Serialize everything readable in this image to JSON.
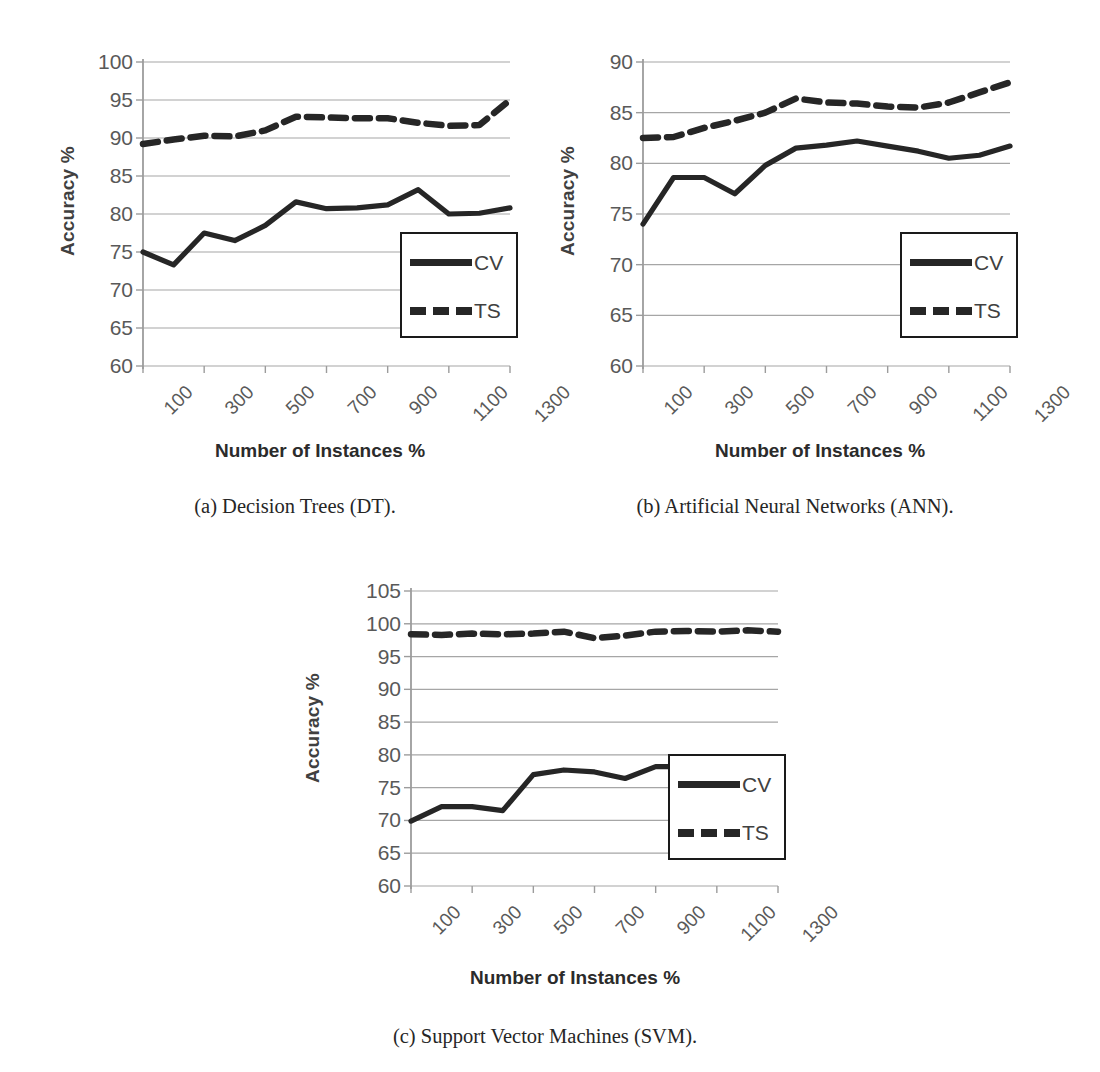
{
  "figure": {
    "axis_titles": {
      "y": "Accuracy %",
      "x": "Number of Instances %"
    },
    "legend": {
      "cv_label": "CV",
      "ts_label": "TS"
    },
    "captions": {
      "a": "(a)  Decision Trees (DT).",
      "b": "(b)  Artificial Neural Networks (ANN).",
      "c": "(c)  Support Vector Machines (SVM)."
    },
    "colors": {
      "line": "#262626",
      "gridline": "#a6a6a6",
      "axis": "#9c9c9c",
      "tick_text": "#595959",
      "title_text": "#2b2b2b"
    }
  },
  "chart_data": [
    {
      "id": "dt",
      "type": "line",
      "title": "(a)  Decision Trees (DT).",
      "xlabel": "Number of Instances %",
      "ylabel": "Accuracy %",
      "ylim": [
        60,
        100
      ],
      "yticks": [
        60,
        65,
        70,
        75,
        80,
        85,
        90,
        95,
        100
      ],
      "x": [
        100,
        200,
        300,
        400,
        500,
        600,
        700,
        800,
        900,
        1000,
        1100,
        1200,
        1300
      ],
      "xtick_labels": [
        "100",
        "300",
        "500",
        "700",
        "900",
        "1100",
        "1300"
      ],
      "xtick_values": [
        100,
        300,
        500,
        700,
        900,
        1100,
        1300
      ],
      "grid": true,
      "legend_position": "lower-right",
      "series": [
        {
          "name": "CV",
          "style": "solid",
          "values": [
            75.0,
            73.3,
            77.5,
            76.5,
            78.5,
            81.6,
            80.7,
            80.8,
            81.2,
            83.2,
            80.0,
            80.1,
            80.8
          ]
        },
        {
          "name": "TS",
          "style": "dashed",
          "values": [
            89.2,
            89.8,
            90.3,
            90.2,
            91.0,
            92.8,
            92.7,
            92.6,
            92.6,
            92.0,
            91.6,
            91.7,
            95.0
          ]
        }
      ]
    },
    {
      "id": "ann",
      "type": "line",
      "title": "(b)  Artificial Neural Networks (ANN).",
      "xlabel": "Number of Instances %",
      "ylabel": "Accuracy %",
      "ylim": [
        60,
        90
      ],
      "yticks": [
        60,
        65,
        70,
        75,
        80,
        85,
        90
      ],
      "x": [
        100,
        200,
        300,
        400,
        500,
        600,
        700,
        800,
        900,
        1000,
        1100,
        1200,
        1300
      ],
      "xtick_labels": [
        "100",
        "300",
        "500",
        "700",
        "900",
        "1100",
        "1300"
      ],
      "xtick_values": [
        100,
        300,
        500,
        700,
        900,
        1100,
        1300
      ],
      "grid": true,
      "legend_position": "lower-right",
      "series": [
        {
          "name": "CV",
          "style": "solid",
          "values": [
            74.0,
            78.6,
            78.6,
            77.0,
            79.8,
            81.5,
            81.8,
            82.2,
            81.7,
            81.2,
            80.5,
            80.8,
            81.7
          ]
        },
        {
          "name": "TS",
          "style": "dashed",
          "values": [
            82.5,
            82.6,
            83.5,
            84.2,
            85.0,
            86.4,
            86.0,
            85.9,
            85.6,
            85.5,
            86.0,
            87.0,
            88.0
          ]
        }
      ]
    },
    {
      "id": "svm",
      "type": "line",
      "title": "(c)  Support Vector Machines (SVM).",
      "xlabel": "Number of Instances %",
      "ylabel": "Accuracy %",
      "ylim": [
        60,
        105
      ],
      "yticks": [
        60,
        65,
        70,
        75,
        80,
        85,
        90,
        95,
        100,
        105
      ],
      "x": [
        100,
        200,
        300,
        400,
        500,
        600,
        700,
        800,
        900,
        1000,
        1100,
        1200,
        1300
      ],
      "xtick_labels": [
        "100",
        "300",
        "500",
        "700",
        "900",
        "1100",
        "1300"
      ],
      "xtick_values": [
        100,
        300,
        500,
        700,
        900,
        1100,
        1300
      ],
      "grid": true,
      "legend_position": "lower-right",
      "series": [
        {
          "name": "CV",
          "style": "solid",
          "values": [
            69.9,
            72.1,
            72.1,
            71.5,
            77.0,
            77.7,
            77.4,
            76.4,
            78.2,
            78.2,
            78.6,
            78.0,
            78.6
          ]
        },
        {
          "name": "TS",
          "style": "dashed",
          "values": [
            98.4,
            98.3,
            98.5,
            98.4,
            98.5,
            98.8,
            97.8,
            98.2,
            98.8,
            98.9,
            98.8,
            99.0,
            98.8
          ]
        }
      ]
    }
  ]
}
